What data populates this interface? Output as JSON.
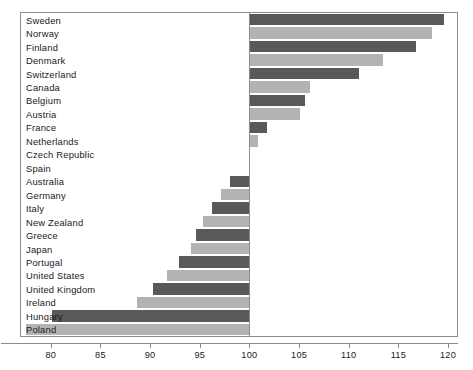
{
  "chart_data": {
    "type": "bar",
    "orientation": "horizontal",
    "title": "",
    "subtitle": "",
    "xlabel": "",
    "ylabel": "",
    "xlim": [
      77.0,
      120.9
    ],
    "ylim": null,
    "grid": false,
    "legend": null,
    "baseline": 100,
    "xticks": [
      80,
      85,
      90,
      95,
      100,
      105,
      110,
      115,
      120
    ],
    "xtick_labels": [
      "80",
      "85",
      "90",
      "95",
      "100",
      "105",
      "110",
      "115",
      "120"
    ],
    "categories": [
      "Sweden",
      "Norway",
      "Finland",
      "Denmark",
      "Switzerland",
      "Canada",
      "Belgium",
      "Austria",
      "France",
      "Netherlands",
      "Czech Republic",
      "Spain",
      "Australia",
      "Germany",
      "Italy",
      "New Zealand",
      "Greece",
      "Japan",
      "Portugal",
      "United States",
      "United Kingdom",
      "Ireland",
      "Hungary",
      "Poland"
    ],
    "values": [
      119.6,
      118.4,
      116.8,
      113.4,
      111.0,
      106.1,
      105.6,
      105.1,
      101.8,
      100.9,
      100.1,
      100.0,
      98.0,
      97.1,
      96.2,
      95.3,
      94.6,
      94.1,
      92.9,
      91.7,
      90.3,
      88.7,
      80.1,
      77.5
    ],
    "bar_colors": [
      "#595959",
      "#b3b3b3",
      "#595959",
      "#b3b3b3",
      "#595959",
      "#b3b3b3",
      "#595959",
      "#b3b3b3",
      "#595959",
      "#b3b3b3",
      "#595959",
      "#b3b3b3",
      "#595959",
      "#b3b3b3",
      "#595959",
      "#b3b3b3",
      "#595959",
      "#b3b3b3",
      "#595959",
      "#b3b3b3",
      "#595959",
      "#b3b3b3",
      "#595959",
      "#b3b3b3"
    ]
  },
  "colors": {
    "bar_dark": "#595959",
    "bar_light": "#b3b3b3",
    "frame": "#8c8c8c",
    "text": "#1a1a1a",
    "background": "#ffffff"
  }
}
